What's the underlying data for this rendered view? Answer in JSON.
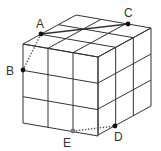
{
  "diagram": {
    "grid_size": 3,
    "vertices": {
      "front_top_left": [
        23,
        44
      ],
      "front_top_right": [
        98,
        57
      ],
      "front_bottom_left": [
        23,
        123
      ],
      "front_bottom_right": [
        98,
        135
      ],
      "back_top_left": [
        76,
        15
      ],
      "back_top_right": [
        151,
        28
      ],
      "back_bottom_right": [
        151,
        105
      ]
    },
    "points": [
      {
        "id": "A",
        "label": "A",
        "x": 41,
        "y": 34,
        "label_x": 36,
        "label_y": 28,
        "color": "#111111"
      },
      {
        "id": "B",
        "label": "B",
        "x": 23,
        "y": 70,
        "label_x": 6,
        "label_y": 75,
        "color": "#111111"
      },
      {
        "id": "C",
        "label": "C",
        "x": 128,
        "y": 24,
        "label_x": 124,
        "label_y": 17,
        "color": "#111111"
      },
      {
        "id": "D",
        "label": "D",
        "x": 115,
        "y": 126,
        "label_x": 114,
        "label_y": 141,
        "color": "#111111"
      },
      {
        "id": "E",
        "label": "E",
        "x": 73,
        "y": 131,
        "label_x": 63,
        "label_y": 147,
        "color": "#777777"
      }
    ],
    "segments": [
      {
        "from": "A",
        "to": "C",
        "style": "solid"
      },
      {
        "from": "A",
        "to": "B",
        "style": "dotted"
      },
      {
        "from": "E",
        "to": "D",
        "style": "dotted"
      }
    ]
  }
}
